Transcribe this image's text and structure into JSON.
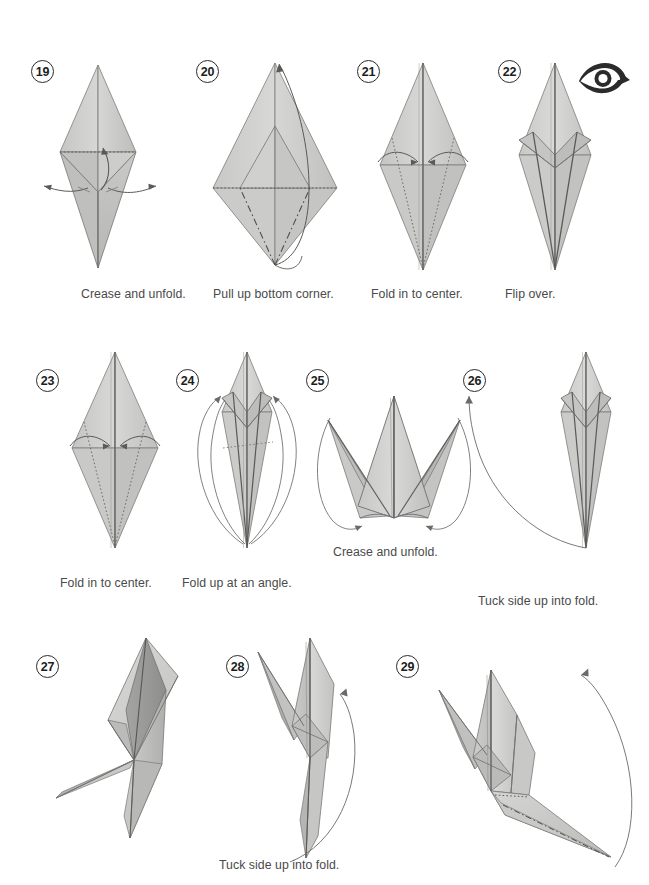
{
  "page": {
    "kind": "origami-instruction-sheet",
    "background_color": "#ffffff",
    "width": 649,
    "height": 885
  },
  "palette": {
    "paper_light": "#d4d5d2",
    "paper_mid": "#c4c5c2",
    "paper_dark": "#a9aaa7",
    "paper_darkest": "#8e8f8c",
    "outline": "#6e6f6c",
    "crease_solid": "#555654",
    "crease_dotted": "#6b6c69",
    "arrow": "#5a5b58",
    "text": "#4a4a4a",
    "number_text": "#1d1d1d",
    "number_ring": "#2b2b2b",
    "flip_icon": "#2b2b2b"
  },
  "rows": [
    {
      "row_index": 0,
      "steps": [
        {
          "number": "19",
          "caption": "Crease and unfold.",
          "figure": "diamond-with-side-flaps",
          "arrows": [
            "curved-up-arrow-center",
            "left-spread-arrow",
            "right-spread-arrow"
          ],
          "crease_style": "dotted-horizontal"
        },
        {
          "number": "20",
          "caption": "Pull up bottom corner.",
          "figure": "wide-kite-open",
          "arrows": [
            "long-curve-bottom-to-top"
          ],
          "crease_style": "dashed-valley-and-dotted-horizontal"
        },
        {
          "number": "21",
          "caption": "Fold in to center.",
          "figure": "narrow-diamond-tall",
          "arrows": [
            "arrow-left-to-center",
            "arrow-right-to-center"
          ],
          "crease_style": "dotted-diagonals"
        },
        {
          "number": "22",
          "caption": "Flip over.",
          "figure": "narrow-diamond-folded",
          "arrows": [],
          "icon": "flip-over-icon",
          "crease_style": "solid-creases"
        }
      ]
    },
    {
      "row_index": 1,
      "steps": [
        {
          "number": "23",
          "caption": "Fold in to center.",
          "figure": "narrow-diamond-tall",
          "arrows": [
            "arrow-left-to-center",
            "arrow-right-to-center"
          ],
          "crease_style": "dotted-diagonals"
        },
        {
          "number": "24",
          "caption": "Fold up at an angle.",
          "figure": "narrow-diamond-folded-slim",
          "arrows": [
            "big-loop-left-up",
            "big-loop-right-up"
          ],
          "crease_style": "dotted-angled"
        },
        {
          "number": "25",
          "caption": "Crease and unfold.",
          "figure": "crown-three-points",
          "arrows": [
            "loop-left-in",
            "loop-right-in"
          ],
          "crease_style": "solid-creases"
        },
        {
          "number": "26",
          "caption": "Tuck side up into fold.",
          "figure": "narrow-diamond-folded-slim",
          "arrows": [
            "long-swoop-up-left"
          ],
          "crease_style": "solid-creases"
        }
      ]
    },
    {
      "row_index": 2,
      "steps": [
        {
          "number": "27",
          "caption": "",
          "figure": "three-d-angled-model",
          "arrows": [],
          "crease_style": "solid-creases"
        },
        {
          "number": "28",
          "caption": "Tuck side up into fold.",
          "figure": "three-d-upright-model",
          "arrows": [
            "long-swoop-up-right"
          ],
          "crease_style": "solid-creases"
        },
        {
          "number": "29",
          "caption": "",
          "figure": "three-d-model-with-long-tail",
          "arrows": [
            "long-swoop-up-right"
          ],
          "crease_style": "dashed-on-tail"
        }
      ]
    }
  ],
  "captions_flat": [
    "Crease and unfold.",
    "Pull up bottom corner.",
    "Fold in to center.",
    "Flip over.",
    "Fold in to center.",
    "Fold up at an angle.",
    "Crease and unfold.",
    "Tuck side up into fold.",
    "Tuck side up into fold."
  ],
  "icons": {
    "flip_over": "flip-over-icon"
  }
}
